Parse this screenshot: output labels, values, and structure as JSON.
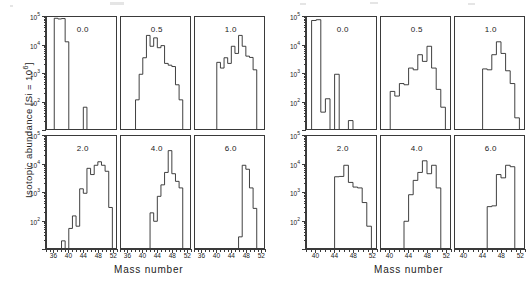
{
  "figure": {
    "ylabel_text": "Isotopic abundance [Si = 10",
    "ylabel_sup": "6",
    "ylabel_tail": "]",
    "xlabel": "Mass number"
  },
  "chart_data": {
    "type": "bar",
    "title": "",
    "xlabel": "Mass number",
    "ylabel": "Isotopic abundance [Si = 10^6]",
    "yscale": "log",
    "ylim": [
      10,
      100000
    ],
    "ytick_labels": [
      "10",
      "10",
      "10",
      "10"
    ],
    "ytick_exponents": [
      "5",
      "4",
      "3",
      "2"
    ],
    "ytick_values": [
      100000,
      10000,
      1000,
      100
    ],
    "grid": false,
    "legend": null,
    "panel_rows": 2,
    "panel_cols": 3,
    "groups": [
      {
        "name": "left-group",
        "xlim": [
          34,
          53
        ],
        "xtick_labels": [
          "36",
          "40",
          "44",
          "48",
          "52"
        ],
        "xtick_values": [
          36,
          40,
          44,
          48,
          52
        ],
        "panels": [
          {
            "label": "0.0",
            "row": 0,
            "col": 0,
            "categories": [
              36,
              37,
              38,
              39,
              40,
              41,
              42,
              43,
              44,
              45,
              46,
              47,
              48,
              49,
              50,
              51,
              52
            ],
            "values": [
              90000,
              85000,
              88000,
              13000,
              0,
              0,
              0,
              0,
              60,
              0,
              0,
              0,
              0,
              0,
              0,
              0,
              0
            ]
          },
          {
            "label": "0.5",
            "row": 0,
            "col": 1,
            "categories": [
              36,
              37,
              38,
              39,
              40,
              41,
              42,
              43,
              44,
              45,
              46,
              47,
              48,
              49,
              50,
              51,
              52
            ],
            "values": [
              0,
              0,
              110,
              900,
              3500,
              22000,
              9000,
              18000,
              8000,
              9500,
              2200,
              1900,
              1700,
              380,
              110,
              0,
              0
            ]
          },
          {
            "label": "1.0",
            "row": 0,
            "col": 2,
            "categories": [
              36,
              37,
              38,
              39,
              40,
              41,
              42,
              43,
              44,
              45,
              46,
              47,
              48,
              49,
              50,
              51,
              52
            ],
            "values": [
              0,
              0,
              0,
              0,
              2400,
              1500,
              3500,
              2200,
              9000,
              5000,
              22000,
              9000,
              4000,
              3600,
              1300,
              0,
              0
            ]
          },
          {
            "label": "2.0",
            "row": 1,
            "col": 0,
            "categories": [
              36,
              37,
              38,
              39,
              40,
              41,
              42,
              43,
              44,
              45,
              46,
              47,
              48,
              49,
              50,
              51,
              52
            ],
            "values": [
              0,
              0,
              18,
              0,
              50,
              140,
              60,
              1300,
              900,
              7000,
              4200,
              9000,
              12000,
              9000,
              5500,
              280,
              0
            ]
          },
          {
            "label": "4.0",
            "row": 1,
            "col": 1,
            "categories": [
              36,
              37,
              38,
              39,
              40,
              41,
              42,
              43,
              44,
              45,
              46,
              47,
              48,
              49,
              50,
              51,
              52
            ],
            "values": [
              0,
              0,
              0,
              0,
              0,
              0,
              180,
              90,
              700,
              1800,
              5000,
              30000,
              4500,
              2400,
              1400,
              0,
              0
            ]
          },
          {
            "label": "6.0",
            "row": 1,
            "col": 2,
            "categories": [
              36,
              37,
              38,
              39,
              40,
              41,
              42,
              43,
              44,
              45,
              46,
              47,
              48,
              49,
              50,
              51,
              52
            ],
            "values": [
              0,
              0,
              0,
              0,
              0,
              0,
              0,
              0,
              0,
              0,
              25,
              9000,
              6500,
              1400,
              260,
              0,
              0
            ]
          }
        ]
      },
      {
        "name": "right-group",
        "xlim": [
          38,
          53
        ],
        "xtick_labels": [
          "40",
          "44",
          "48",
          "52"
        ],
        "xtick_values": [
          40,
          44,
          48,
          52
        ],
        "panels": [
          {
            "label": "0.0",
            "row": 0,
            "col": 0,
            "categories": [
              39,
              40,
              41,
              42,
              43,
              44,
              45,
              46,
              47,
              48,
              49,
              50,
              51,
              52
            ],
            "values": [
              75000,
              80000,
              40,
              120,
              0,
              900,
              0,
              0,
              20,
              0,
              0,
              0,
              0,
              0
            ]
          },
          {
            "label": "0.5",
            "row": 0,
            "col": 1,
            "categories": [
              39,
              40,
              41,
              42,
              43,
              44,
              45,
              46,
              47,
              48,
              49,
              50,
              51,
              52
            ],
            "values": [
              0,
              220,
              150,
              420,
              380,
              1500,
              1300,
              4500,
              2600,
              9000,
              1500,
              260,
              60,
              0
            ]
          },
          {
            "label": "1.0",
            "row": 0,
            "col": 2,
            "categories": [
              39,
              40,
              41,
              42,
              43,
              44,
              45,
              46,
              47,
              48,
              49,
              50,
              51,
              52
            ],
            "values": [
              0,
              0,
              0,
              0,
              0,
              1400,
              1300,
              4500,
              13000,
              5000,
              1200,
              420,
              25,
              0
            ]
          },
          {
            "label": "2.0",
            "row": 1,
            "col": 0,
            "categories": [
              39,
              40,
              41,
              42,
              43,
              44,
              45,
              46,
              47,
              48,
              49,
              50,
              51,
              52
            ],
            "values": [
              0,
              0,
              0,
              0,
              0,
              3500,
              3600,
              9000,
              2200,
              1500,
              1400,
              420,
              60,
              0
            ]
          },
          {
            "label": "4.0",
            "row": 1,
            "col": 1,
            "categories": [
              39,
              40,
              41,
              42,
              43,
              44,
              45,
              46,
              47,
              48,
              49,
              50,
              51,
              52
            ],
            "values": [
              0,
              0,
              0,
              0,
              90,
              800,
              2600,
              5000,
              13000,
              4500,
              9000,
              1400,
              0,
              0
            ]
          },
          {
            "label": "6.0",
            "row": 1,
            "col": 2,
            "categories": [
              39,
              40,
              41,
              42,
              43,
              44,
              45,
              46,
              47,
              48,
              49,
              50,
              51,
              52
            ],
            "values": [
              0,
              0,
              0,
              0,
              0,
              0,
              300,
              320,
              4200,
              3200,
              9000,
              8000,
              0,
              0
            ]
          }
        ]
      }
    ]
  }
}
